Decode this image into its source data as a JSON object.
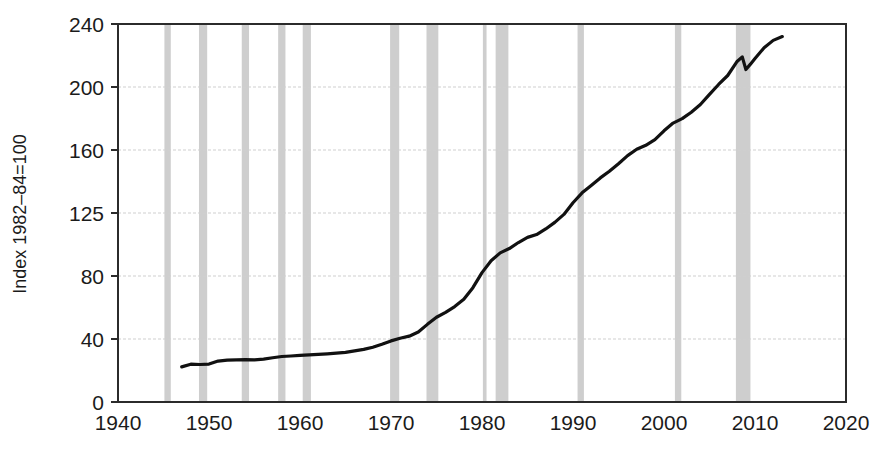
{
  "chart_data": {
    "type": "line",
    "title": "",
    "subtitle": "",
    "xlabel": "",
    "ylabel": "Index 1982–84=100",
    "xlim": [
      1940,
      2020
    ],
    "ylim": [
      0,
      240
    ],
    "grid": true,
    "legend_position": "none",
    "y_scale_note": "non-linear tick spacing: ticks are evenly spaced in pixels",
    "yticks": [
      0,
      40,
      80,
      125,
      160,
      200,
      240
    ],
    "ytick_labels": [
      "0",
      "40",
      "80",
      "125",
      "160",
      "200",
      "240"
    ],
    "xticks": [
      1940,
      1950,
      1960,
      1970,
      1980,
      1990,
      2000,
      2010,
      2020
    ],
    "xtick_labels": [
      "1940",
      "1950",
      "1960",
      "1970",
      "1980",
      "1990",
      "2000",
      "2010",
      "2020"
    ],
    "series": [
      {
        "name": "Consumer Price Index",
        "color": "#111111",
        "x": [
          1947.0,
          1948.0,
          1949.0,
          1950.0,
          1951.0,
          1952.0,
          1953.0,
          1954.0,
          1955.0,
          1956.0,
          1957.0,
          1958.0,
          1959.0,
          1960.0,
          1961.0,
          1962.0,
          1963.0,
          1964.0,
          1965.0,
          1966.0,
          1967.0,
          1968.0,
          1969.0,
          1970.0,
          1971.0,
          1972.0,
          1973.0,
          1974.0,
          1975.0,
          1976.0,
          1977.0,
          1978.0,
          1979.0,
          1980.0,
          1981.0,
          1982.0,
          1983.0,
          1984.0,
          1985.0,
          1986.0,
          1987.0,
          1988.0,
          1989.0,
          1990.0,
          1991.0,
          1992.0,
          1993.0,
          1994.0,
          1995.0,
          1996.0,
          1997.0,
          1998.0,
          1999.0,
          2000.0,
          2001.0,
          2002.0,
          2003.0,
          2004.0,
          2005.0,
          2006.0,
          2007.0,
          2008.0,
          2008.6,
          2009.0,
          2009.5,
          2010.0,
          2011.0,
          2012.0,
          2013.0
        ],
        "y": [
          22.3,
          24.0,
          23.8,
          24.1,
          26.0,
          26.6,
          26.8,
          26.9,
          26.8,
          27.2,
          28.1,
          28.9,
          29.2,
          29.6,
          29.9,
          30.3,
          30.6,
          31.0,
          31.5,
          32.5,
          33.4,
          34.8,
          36.7,
          38.8,
          40.5,
          41.8,
          44.4,
          49.3,
          53.8,
          56.9,
          60.6,
          65.2,
          72.6,
          82.4,
          90.9,
          96.5,
          99.6,
          103.9,
          107.6,
          109.6,
          113.6,
          118.3,
          124.0,
          130.7,
          136.2,
          140.3,
          144.5,
          148.2,
          152.4,
          156.9,
          160.5,
          163.0,
          166.6,
          172.2,
          177.1,
          179.9,
          184.0,
          188.9,
          195.3,
          201.6,
          207.3,
          216.0,
          219.1,
          211.1,
          214.5,
          218.1,
          224.9,
          229.6,
          232.0
        ]
      }
    ],
    "annotations": {
      "recession_bands_label": "NBER recessions (shaded)",
      "recession_bands": [
        {
          "start": 1945.1,
          "end": 1945.8
        },
        {
          "start": 1948.9,
          "end": 1949.8
        },
        {
          "start": 1953.6,
          "end": 1954.4
        },
        {
          "start": 1957.6,
          "end": 1958.4
        },
        {
          "start": 1960.3,
          "end": 1961.2
        },
        {
          "start": 1969.9,
          "end": 1970.9
        },
        {
          "start": 1973.9,
          "end": 1975.2
        },
        {
          "start": 1980.1,
          "end": 1980.5
        },
        {
          "start": 1981.5,
          "end": 1982.9
        },
        {
          "start": 1990.5,
          "end": 1991.2
        },
        {
          "start": 2001.2,
          "end": 2001.9
        },
        {
          "start": 2007.9,
          "end": 2009.5
        }
      ]
    },
    "colors": {
      "line": "#111111",
      "recession_band": "#c6c6c6",
      "gridline": "#cfcfcf",
      "axis": "#2b2b2b",
      "background": "#ffffff"
    }
  }
}
